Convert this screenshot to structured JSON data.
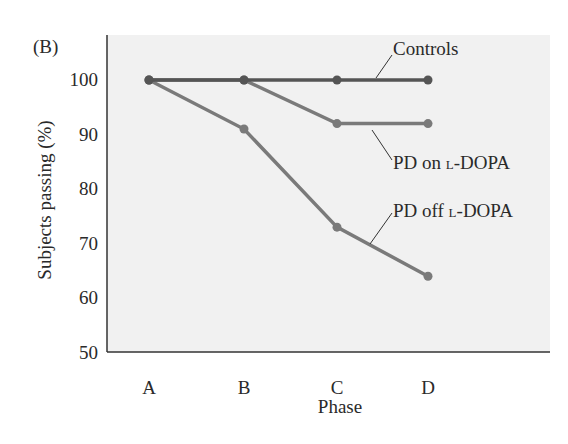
{
  "panel_label": "(B)",
  "chart_data": {
    "type": "line",
    "title": "",
    "xlabel": "Phase",
    "ylabel": "Subjects passing (%)",
    "categories": [
      "A",
      "B",
      "C",
      "D"
    ],
    "ylim": [
      50,
      100
    ],
    "yticks": [
      100,
      90,
      80,
      70,
      60,
      50
    ],
    "grid": false,
    "legend_position": "inline labels",
    "series": [
      {
        "name": "Controls",
        "values": [
          100,
          100,
          100,
          100
        ],
        "color": "#555555"
      },
      {
        "name": "PD on L-DOPA",
        "values": [
          100,
          100,
          92,
          92
        ],
        "color": "#7a7a7a"
      },
      {
        "name": "PD off L-DOPA",
        "values": [
          100,
          91,
          73,
          64
        ],
        "color": "#7a7a7a"
      }
    ]
  },
  "labels": {
    "controls": "Controls",
    "pd_on_prefix": "PD on ",
    "pd_on_drug": "l-DOPA",
    "pd_off_prefix": "PD off ",
    "pd_off_drug": "l-DOPA"
  },
  "colors": {
    "plot_background": "#f1f1f1",
    "axis": "#333333"
  }
}
